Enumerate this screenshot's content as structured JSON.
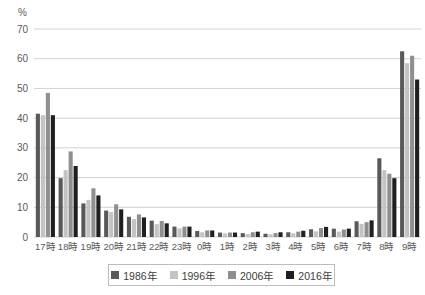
{
  "chart_data": {
    "type": "bar",
    "title": "",
    "unit_label": "%",
    "xlabel": "",
    "ylabel": "%",
    "ylim": [
      0,
      70
    ],
    "ytick_step": 10,
    "grid": "horizontal",
    "legend_position": "bottom",
    "categories": [
      "17時",
      "18時",
      "19時",
      "20時",
      "21時",
      "22時",
      "23時",
      "0時",
      "1時",
      "2時",
      "3時",
      "4時",
      "5時",
      "6時",
      "7時",
      "8時",
      "9時"
    ],
    "series": [
      {
        "name": "1986年",
        "color": "#595959",
        "values": [
          41.5,
          19.8,
          11.3,
          8.9,
          6.8,
          5.5,
          3.5,
          2.0,
          1.5,
          1.3,
          1.1,
          1.6,
          2.6,
          2.8,
          5.3,
          26.5,
          62.5
        ]
      },
      {
        "name": "1996年",
        "color": "#c3c3c3",
        "values": [
          41.0,
          22.5,
          12.5,
          8.4,
          6.0,
          4.3,
          2.9,
          1.6,
          1.2,
          1.0,
          0.9,
          1.2,
          1.9,
          1.8,
          4.4,
          22.5,
          58.5
        ]
      },
      {
        "name": "2006年",
        "color": "#8f8f8f",
        "values": [
          48.5,
          28.8,
          16.4,
          11.0,
          7.6,
          5.4,
          3.5,
          2.2,
          1.5,
          1.6,
          1.3,
          1.8,
          3.0,
          2.5,
          5.0,
          21.3,
          61.0
        ]
      },
      {
        "name": "2016年",
        "color": "#1f1f1f",
        "values": [
          41.0,
          23.9,
          14.0,
          9.3,
          6.6,
          4.6,
          3.5,
          2.2,
          1.5,
          1.8,
          1.6,
          2.1,
          3.4,
          2.8,
          5.6,
          19.8,
          53.0
        ]
      }
    ],
    "colors": {
      "gridline": "#d2d2d2",
      "axis_text": "#595959",
      "legend_border": "#bdbdbd"
    }
  }
}
